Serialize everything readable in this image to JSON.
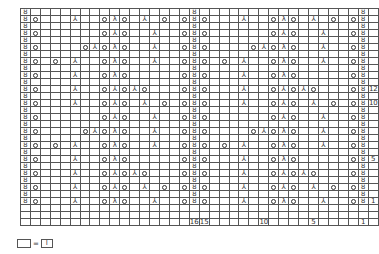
{
  "chart": {
    "columns": 34,
    "symbols": {
      "T": {
        "name": "twisted-knit",
        "glyph": "ȣ"
      },
      "O": {
        "name": "yarn-over",
        "glyph": "○"
      },
      "Y": {
        "name": "central-double-decrease",
        "glyph": "⅄"
      },
      "L": {
        "name": "left-decrease",
        "glyph": "⅄"
      },
      "R": {
        "name": "right-decrease",
        "glyph": "λ"
      },
      ".": {
        "name": "knit",
        "glyph": ""
      }
    },
    "rows": [
      "T................T................T",
      "TO...Y..ORO.Y.O.OTO...Y..ORO.Y.O.OT",
      "T................T................T",
      "TO......OYO..Y..OTO......OYO..Y..OT",
      "T................T................T",
      "TO....OYORO..Y..OTO....OYORO..Y..OT",
      "T................T................T",
      "TO.O.Y..ORO..Y..OTO.O.Y..ORO..Y..OT",
      "T................T................T",
      "TO...Y..ORO.....OTO...Y..ORO.....OT",
      "T................T................T",
      "TO...Y..OLOYO...OTO...Y..OLOYO...OT",
      "T................T................T",
      "TO...Y..OLO.Y.O.OTO...Y..OLO.Y.O.OT",
      "T................T................T",
      "TO......OLO..Y..OTO......OLO..Y..OT",
      "T................T................T",
      "TO....OYORO..Y..OTO....OYORO..Y..OT",
      "T................T................T",
      "TO.O.Y..ORO..Y..OTO.O.Y..ORO..Y..OT",
      "T................T................T",
      "TO...Y..ORO.....OTO...Y..ORO.....OT",
      "T................T................T",
      "TO...Y..OLOYO...OTO...Y..OLOYO...OT",
      "T................T................T",
      "TO...Y..OLO.Y.O.OTO...Y..OLO.Y.O.OT",
      "T................T................T",
      "TO...Y..ORO..Y..OTO...Y..ORO..Y..OT",
      "...................................",
      "..................................."
    ],
    "row_labels": {
      "11": "12",
      "13": "10",
      "21": "5",
      "27": "1"
    },
    "column_labels": {
      "17": "16",
      "18": "15",
      "24": "10",
      "29": "5",
      "34": "1"
    }
  },
  "legend": {
    "left_symbol": "",
    "equals": "=",
    "right_symbol": "I"
  }
}
